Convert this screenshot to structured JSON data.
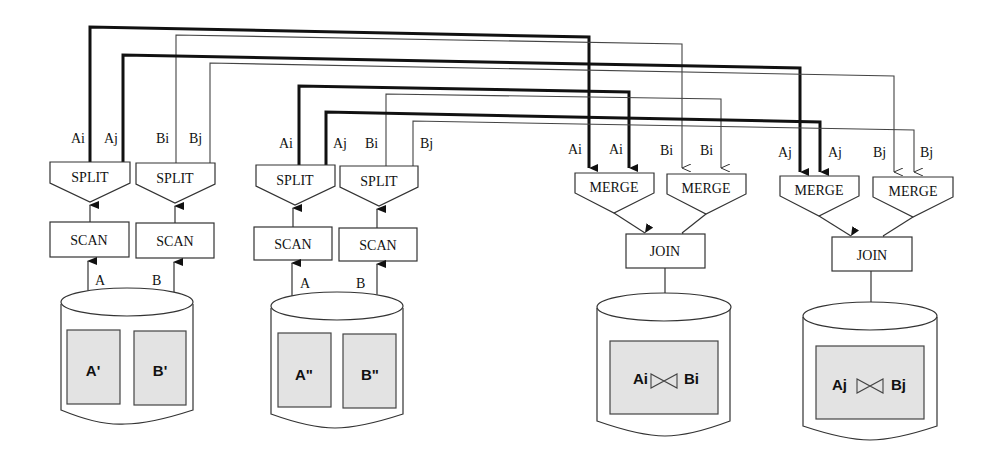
{
  "diagram": {
    "type": "parallel-join dataflow",
    "sources": [
      {
        "id": "site1",
        "relations": [
          {
            "label": "A'"
          },
          {
            "label": "B'"
          }
        ],
        "scans": [
          {
            "label": "SCAN",
            "input": "A"
          },
          {
            "label": "SCAN",
            "input": "B"
          }
        ],
        "splits": [
          {
            "label": "SPLIT",
            "outputs": [
              "Ai",
              "Aj"
            ]
          },
          {
            "label": "SPLIT",
            "outputs": [
              "Bi",
              "Bj"
            ]
          }
        ]
      },
      {
        "id": "site2",
        "relations": [
          {
            "label": "A\""
          },
          {
            "label": "B\""
          }
        ],
        "scans": [
          {
            "label": "SCAN",
            "input": "A"
          },
          {
            "label": "SCAN",
            "input": "B"
          }
        ],
        "splits": [
          {
            "label": "SPLIT",
            "outputs": [
              "Ai",
              "Aj"
            ]
          },
          {
            "label": "SPLIT",
            "outputs": [
              "Bi",
              "Bj"
            ]
          }
        ]
      }
    ],
    "sinks": [
      {
        "id": "sink-i",
        "merges": [
          {
            "label": "MERGE",
            "inputs": [
              "Ai",
              "Ai"
            ]
          },
          {
            "label": "MERGE",
            "inputs": [
              "Bi",
              "Bi"
            ]
          }
        ],
        "join": {
          "label": "JOIN"
        },
        "result": {
          "left": "Ai",
          "op": "⋈",
          "right": "Bi"
        }
      },
      {
        "id": "sink-j",
        "merges": [
          {
            "label": "MERGE",
            "inputs": [
              "Aj",
              "Aj"
            ]
          },
          {
            "label": "MERGE",
            "inputs": [
              "Bj",
              "Bj"
            ]
          }
        ],
        "join": {
          "label": "JOIN"
        },
        "result": {
          "left": "Aj",
          "op": "⋈",
          "right": "Bj"
        }
      }
    ],
    "legend": {
      "thick_line": "A stream",
      "thin_line": "B stream"
    }
  }
}
